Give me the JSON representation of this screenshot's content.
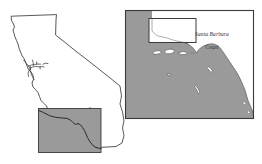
{
  "figure": {
    "type": "locator-map",
    "background_color": "#ffffff",
    "panels": [
      {
        "id": "california-state-outline",
        "name": "California State Outline",
        "role": "overview",
        "outline_color": "#3a3a3a",
        "fill_color": "#ffffff",
        "inset_box": {
          "name": "Southern California Study Area",
          "fill_color": "#9a9a9a",
          "stroke_color": "#3a3a3a",
          "coastline_color": "#2a2a2a"
        },
        "interior_detail": {
          "name": "San Francisco Bay and Delta",
          "stroke_color": "#3a3a3a"
        }
      },
      {
        "id": "southern-california-bight-detail",
        "name": "Southern California Bight Detail",
        "role": "detail",
        "frame_color": "#3a3a3a",
        "land_fill": "#9a9a9a",
        "ocean_fill": "#ffffff",
        "island_fill": "#ffffff",
        "island_stroke": "#4a4a4a",
        "highlight_box": {
          "name": "Santa Barbara Coast highlight rectangle",
          "fill_color": "#ffffff",
          "stroke_color": "#3a3a3a"
        },
        "islands": [
          "San Miguel Island",
          "Santa Rosa Island",
          "Santa Cruz Island",
          "Anacapa Island",
          "Santa Barbara Island",
          "Santa Catalina Island",
          "San Nicolas Island",
          "San Clemente Island"
        ]
      }
    ],
    "label": {
      "name": "santa-barbara-coast-label",
      "line_1": "Santa Barbara",
      "line_2": "Coast",
      "color": "#2a2a2a",
      "style": "italic serif"
    }
  },
  "colors": {
    "land_gray": "#9a9a9a",
    "outline_dark": "#3a3a3a",
    "coastline": "#2a2a2a",
    "white": "#ffffff"
  }
}
